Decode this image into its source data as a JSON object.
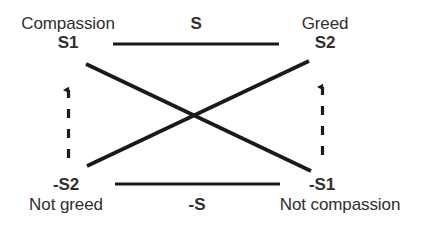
{
  "diagram": {
    "type": "semiotic-square",
    "colors": {
      "background": "#ffffff",
      "text": "#2f2f2f",
      "stroke": "#1a1a1a"
    },
    "nodes": {
      "top_left": {
        "term": "Compassion",
        "code": "S1"
      },
      "top_right": {
        "term": "Greed",
        "code": "S2"
      },
      "bottom_left": {
        "term": "Not greed",
        "code": "-S2"
      },
      "bottom_right": {
        "term": "Not compassion",
        "code": "-S1"
      }
    },
    "axes": {
      "top": "S",
      "bottom": "-S"
    },
    "relations": [
      {
        "name": "contrary-top",
        "from": "S1",
        "to": "S2",
        "style": "solid",
        "label": "S"
      },
      {
        "name": "contrary-bottom",
        "from": "-S2",
        "to": "-S1",
        "style": "solid",
        "label": "-S"
      },
      {
        "name": "contradiction-left-diagonal",
        "from": "S1",
        "to": "-S1",
        "style": "solid"
      },
      {
        "name": "contradiction-right-diagonal",
        "from": "-S2",
        "to": "S2",
        "style": "solid"
      },
      {
        "name": "implication-left",
        "from": "-S2",
        "to": "S1",
        "style": "dashed-arrow"
      },
      {
        "name": "implication-right",
        "from": "-S1",
        "to": "S2",
        "style": "dashed-arrow"
      }
    ]
  }
}
